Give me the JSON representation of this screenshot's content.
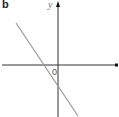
{
  "figure": {
    "panel_label": "b",
    "y_axis_label": "y",
    "x_axis_label": "x",
    "origin_label": "0",
    "line_color": "#9a9a9a",
    "axis_color": "#333333"
  }
}
